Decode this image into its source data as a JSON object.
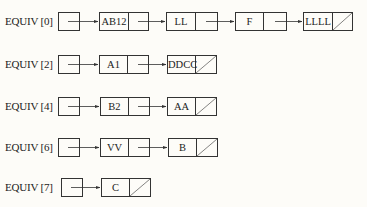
{
  "diagram": {
    "type": "linked-list-array",
    "rows": [
      {
        "label": "EQUIV [0]",
        "nodes": [
          "AB12",
          "LL",
          "F",
          "LLLL"
        ]
      },
      {
        "label": "EQUIV [2]",
        "nodes": [
          "A1",
          "DDCC"
        ]
      },
      {
        "label": "EQUIV [4]",
        "nodes": [
          "B2",
          "AA"
        ]
      },
      {
        "label": "EQUIV [6]",
        "nodes": [
          "VV",
          "B"
        ]
      },
      {
        "label": "EQUIV [7]",
        "nodes": [
          "C"
        ]
      }
    ]
  }
}
